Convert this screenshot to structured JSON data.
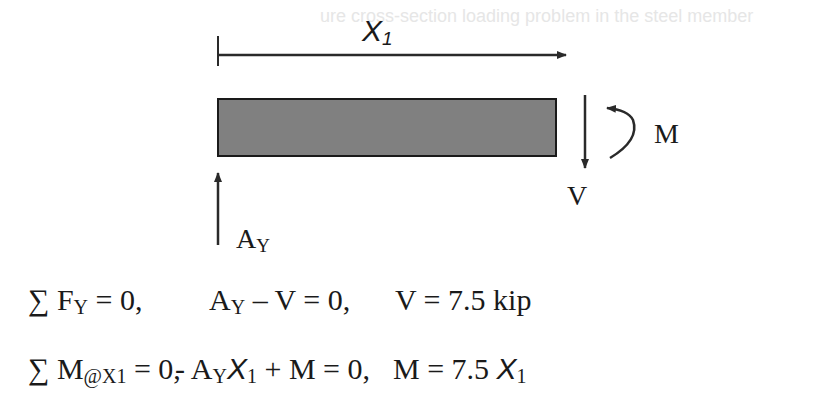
{
  "faint_text": "ure cross-section loading problem in the steel member",
  "diagram": {
    "dimension_label": "X",
    "dimension_sub": "1",
    "moment_label": "M",
    "shear_label": "V",
    "reaction_label": "A",
    "reaction_sub": "Y",
    "beam_color": "#808080"
  },
  "equations": [
    {
      "part1": "∑ F",
      "part1_sub": "Y",
      "part1_end": " = 0,",
      "part2": "A",
      "part2_sub": "Y",
      "part2_end": " – V = 0,",
      "part3": "V = 7.5 kip"
    },
    {
      "part1": "∑ M",
      "part1_sub": "@X1",
      "part1_end": " = 0,",
      "part2": "- A",
      "part2_sub": "Y",
      "part2_x": "X",
      "part2_xsub": "1",
      "part2_end": " + M = 0,",
      "part3": "M = 7.5 ",
      "part3_x": "X",
      "part3_xsub": "1"
    }
  ]
}
